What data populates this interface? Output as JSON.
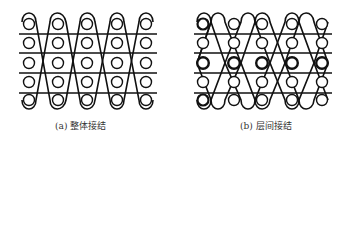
{
  "figures": [
    {
      "id": "a",
      "caption": "(a) 整体接结",
      "rows": 5,
      "cols": 5,
      "bold_rows": []
    },
    {
      "id": "b",
      "caption": "(b) 层间接结",
      "rows": 5,
      "cols": 5,
      "bold_rows": [
        0,
        2,
        4
      ]
    }
  ]
}
